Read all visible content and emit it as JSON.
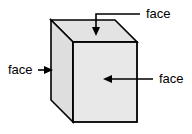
{
  "figure": {
    "background_color": "#ffffff",
    "shape": "cube",
    "stroke_color": "#000000",
    "face_fill_color": "#e6e6e6",
    "top_face_fill": "#e3e3e3",
    "left_face_fill": "#dedede",
    "front_face_fill": "#e8e8e8"
  },
  "labels": {
    "top": "face",
    "left": "face",
    "right": "face"
  },
  "geometry": {
    "back_top_left": "51,20",
    "back_top_right": "115,20",
    "front_top_left": "73,42",
    "front_top_right": "137,42",
    "front_bottom_left": "73,122",
    "front_bottom_right": "137,122",
    "back_bottom_left": "51,100"
  }
}
